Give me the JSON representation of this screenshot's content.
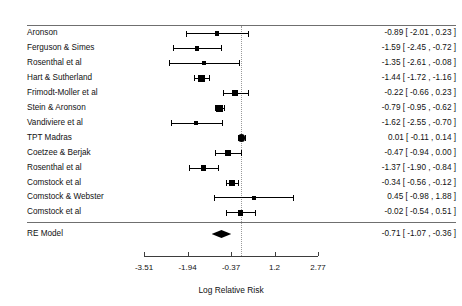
{
  "chart_data": {
    "type": "forest",
    "title": "",
    "xlabel": "Log Relative Risk",
    "ylabel": "",
    "xlim": [
      -3.51,
      2.77
    ],
    "xticks": [
      -3.51,
      -1.94,
      -0.37,
      1.2,
      2.77
    ],
    "xtick_labels": [
      "-3.51",
      "-1.94",
      "-0.37",
      "1.2",
      "2.77"
    ],
    "reference_line": 0,
    "grid": false,
    "legend": null,
    "studies": [
      {
        "label": "Aronson",
        "estimate": -0.89,
        "ci_low": -2.01,
        "ci_high": 0.23,
        "text": "-0.89 [ -2.01 ,  0.23 ]",
        "weight": 0.3
      },
      {
        "label": "Ferguson & Simes",
        "estimate": -1.59,
        "ci_low": -2.45,
        "ci_high": -0.72,
        "text": "-1.59 [ -2.45 , -0.72 ]",
        "weight": 0.38
      },
      {
        "label": "Rosenthal et al",
        "estimate": -1.35,
        "ci_low": -2.61,
        "ci_high": -0.08,
        "text": "-1.35 [ -2.61 , -0.08 ]",
        "weight": 0.26
      },
      {
        "label": "Hart & Sutherland",
        "estimate": -1.44,
        "ci_low": -1.72,
        "ci_high": -1.16,
        "text": "-1.44 [ -1.72 , -1.16 ]",
        "weight": 0.8
      },
      {
        "label": "Frimodt-Moller et al",
        "estimate": -0.22,
        "ci_low": -0.66,
        "ci_high": 0.23,
        "text": "-0.22 [ -0.66 ,  0.23 ]",
        "weight": 0.66
      },
      {
        "label": "Stein & Aronson",
        "estimate": -0.79,
        "ci_low": -0.95,
        "ci_high": -0.62,
        "text": "-0.79 [ -0.95 , -0.62 ]",
        "weight": 0.9
      },
      {
        "label": "Vandiviere et al",
        "estimate": -1.62,
        "ci_low": -2.55,
        "ci_high": -0.7,
        "text": "-1.62 [ -2.55 , -0.70 ]",
        "weight": 0.34
      },
      {
        "label": "TPT Madras",
        "estimate": 0.01,
        "ci_low": -0.11,
        "ci_high": 0.14,
        "text": " 0.01 [ -0.11 ,  0.14 ]",
        "weight": 1.0
      },
      {
        "label": "Coetzee & Berjak",
        "estimate": -0.47,
        "ci_low": -0.94,
        "ci_high": 0.0,
        "text": "-0.47 [ -0.94 ,  0.00 ]",
        "weight": 0.62
      },
      {
        "label": "Rosenthal et al",
        "estimate": -1.37,
        "ci_low": -1.9,
        "ci_high": -0.84,
        "text": "-1.37 [ -1.90 , -0.84 ]",
        "weight": 0.56
      },
      {
        "label": "Comstock et al",
        "estimate": -0.34,
        "ci_low": -0.56,
        "ci_high": -0.12,
        "text": "-0.34 [ -0.56 , -0.12 ]",
        "weight": 0.84
      },
      {
        "label": "Comstock & Webster",
        "estimate": 0.45,
        "ci_low": -0.98,
        "ci_high": 1.88,
        "text": " 0.45 [ -0.98 ,  1.88 ]",
        "weight": 0.22
      },
      {
        "label": "Comstock et al",
        "estimate": -0.02,
        "ci_low": -0.54,
        "ci_high": 0.51,
        "text": "-0.02 [ -0.54 ,  0.51 ]",
        "weight": 0.56
      }
    ],
    "summary": {
      "label": "RE Model",
      "estimate": -0.71,
      "ci_low": -1.07,
      "ci_high": -0.36,
      "text": "-0.71 [ -1.07 , -0.36 ]"
    }
  },
  "colors": {
    "marker": "#000000",
    "reference_line": "#9a9a9a",
    "rule": "#6f6f6f",
    "axis": "#3d3d3d",
    "text": "#111111"
  }
}
